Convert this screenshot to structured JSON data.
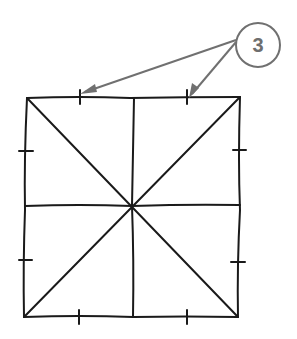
{
  "diagram": {
    "type": "hand-drawn square divided into 8 triangles",
    "callout": {
      "label": "3",
      "arrow_count": 2,
      "color": "#707070"
    },
    "line_color": "#1a1a1a",
    "tick_marks_per_side": 2
  }
}
